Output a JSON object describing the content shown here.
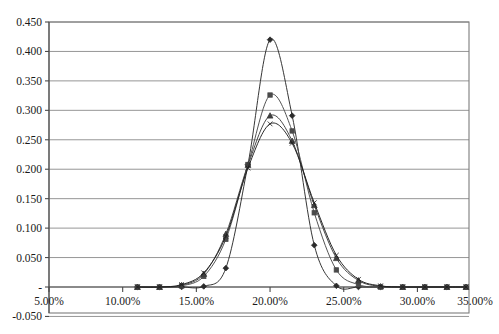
{
  "chart_data": {
    "type": "line",
    "title": "",
    "subtitle": "",
    "xlabel": "",
    "ylabel": "",
    "xlim": [
      0.05,
      0.335
    ],
    "ylim": [
      -0.05,
      0.45
    ],
    "grid": true,
    "legend": "none",
    "x_tick_labels": [
      "5.00%",
      "10.00%",
      "15.00%",
      "20.00%",
      "25.00%",
      "30.00%",
      "35.00%"
    ],
    "x_tick_values": [
      0.05,
      0.1,
      0.15,
      0.2,
      0.25,
      0.3,
      0.35
    ],
    "y_tick_labels": [
      "0.450",
      "0.400",
      "0.350",
      "0.300",
      "0.250",
      "0.200",
      "0.150",
      "0.100",
      "0.050",
      "-",
      "-0.050"
    ],
    "y_tick_values": [
      0.45,
      0.4,
      0.35,
      0.3,
      0.25,
      0.2,
      0.15,
      0.1,
      0.05,
      0.0,
      -0.05
    ],
    "series": [
      {
        "name": "Series 1",
        "marker": "diamond",
        "color": "#2b2b2b",
        "x": [
          0.11,
          0.125,
          0.14,
          0.155,
          0.17,
          0.185,
          0.2,
          0.215,
          0.23,
          0.245,
          0.26,
          0.275,
          0.29,
          0.305,
          0.32,
          0.333
        ],
        "values": [
          0.0,
          0.0,
          0.0,
          0.001,
          0.032,
          0.208,
          0.42,
          0.291,
          0.071,
          0.002,
          0.0,
          0.0,
          0.0,
          0.0,
          0.0,
          0.0
        ]
      },
      {
        "name": "Series 2",
        "marker": "square",
        "color": "#4a4a4a",
        "x": [
          0.11,
          0.125,
          0.14,
          0.155,
          0.17,
          0.185,
          0.2,
          0.215,
          0.23,
          0.245,
          0.26,
          0.275,
          0.29,
          0.305,
          0.32,
          0.333
        ],
        "values": [
          0.0,
          0.0,
          0.002,
          0.018,
          0.081,
          0.208,
          0.326,
          0.265,
          0.126,
          0.029,
          0.004,
          0.0,
          0.0,
          0.0,
          0.0,
          0.0
        ]
      },
      {
        "name": "Series 3",
        "marker": "triangle",
        "color": "#3d3d3d",
        "x": [
          0.11,
          0.125,
          0.14,
          0.155,
          0.17,
          0.185,
          0.2,
          0.215,
          0.23,
          0.245,
          0.26,
          0.275,
          0.29,
          0.305,
          0.32,
          0.333
        ],
        "values": [
          0.0,
          0.0,
          0.003,
          0.022,
          0.09,
          0.207,
          0.291,
          0.248,
          0.139,
          0.049,
          0.011,
          0.001,
          0.0,
          0.0,
          0.0,
          0.0
        ]
      },
      {
        "name": "Series 4",
        "marker": "cross",
        "color": "#1f1f1f",
        "x": [
          0.11,
          0.125,
          0.14,
          0.155,
          0.17,
          0.185,
          0.2,
          0.215,
          0.23,
          0.245,
          0.26,
          0.275,
          0.29,
          0.305,
          0.32,
          0.333
        ],
        "values": [
          0.0,
          0.0,
          0.004,
          0.024,
          0.086,
          0.202,
          0.277,
          0.244,
          0.143,
          0.054,
          0.013,
          0.002,
          0.0,
          0.0,
          0.0,
          0.0
        ]
      }
    ]
  }
}
